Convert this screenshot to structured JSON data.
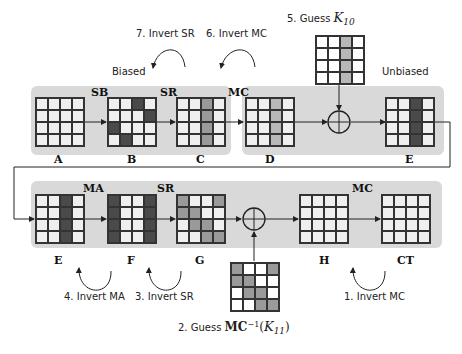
{
  "colors": {
    "panel": "#d9d9d9",
    "cell_light": "#efefef",
    "cell_white": "#ffffff",
    "cell_dark": "#4a4a4a",
    "cell_medium": "#9a9a9a",
    "cell_lightgray": "#b8b8b8",
    "line": "#222222"
  },
  "top_row": {
    "annotations": {
      "biased": "Biased",
      "unbiased": "Unbiased",
      "step7": "7. Invert SR",
      "step6": "6. Invert MC",
      "step5_prefix": "5. Guess",
      "step5_key": "K",
      "step5_sub": "10"
    },
    "ops": {
      "sb": "SB",
      "sr": "SR",
      "mc": "MC"
    },
    "states": [
      {
        "label": "A",
        "cells": [
          "g",
          "g",
          "g",
          "g",
          "g",
          "g",
          "g",
          "g",
          "g",
          "g",
          "g",
          "g",
          "g",
          "g",
          "g",
          "g"
        ]
      },
      {
        "label": "B",
        "cells": [
          "g",
          "g",
          "d",
          "g",
          "g",
          "g",
          "g",
          "d",
          "d",
          "g",
          "g",
          "g",
          "g",
          "d",
          "g",
          "g"
        ]
      },
      {
        "label": "C",
        "cells": [
          "g",
          "g",
          "m",
          "g",
          "g",
          "g",
          "m",
          "g",
          "g",
          "g",
          "m",
          "g",
          "g",
          "g",
          "m",
          "g"
        ]
      },
      {
        "label": "D",
        "cells": [
          "g",
          "g",
          "l",
          "g",
          "g",
          "g",
          "l",
          "g",
          "g",
          "g",
          "l",
          "g",
          "g",
          "g",
          "l",
          "g"
        ]
      },
      {
        "label": "E",
        "cells": [
          "g",
          "g",
          "d",
          "g",
          "g",
          "g",
          "d",
          "g",
          "g",
          "g",
          "d",
          "g",
          "g",
          "g",
          "d",
          "g"
        ]
      }
    ],
    "key_grid": {
      "cells": [
        "w",
        "w",
        "l",
        "w",
        "w",
        "w",
        "l",
        "w",
        "w",
        "w",
        "l",
        "w",
        "w",
        "w",
        "l",
        "w"
      ]
    }
  },
  "bottom_row": {
    "annotations": {
      "step4": "4. Invert MA",
      "step3": "3. Invert SR",
      "step2_prefix": "2. Guess",
      "step2_mc": "MC",
      "step2_sup": "−1",
      "step2_key": "K",
      "step2_sub": "11",
      "step1": "1. Invert MC"
    },
    "ops": {
      "ma": "MA",
      "sr": "SR",
      "mc": "MC"
    },
    "states": [
      {
        "label": "E",
        "cells": [
          "g",
          "g",
          "d",
          "g",
          "g",
          "g",
          "d",
          "g",
          "g",
          "g",
          "d",
          "g",
          "g",
          "g",
          "d",
          "g"
        ]
      },
      {
        "label": "F",
        "cells": [
          "d",
          "g",
          "g",
          "d",
          "d",
          "g",
          "g",
          "d",
          "d",
          "g",
          "g",
          "d",
          "d",
          "g",
          "g",
          "d"
        ]
      },
      {
        "label": "G",
        "cells": [
          "m",
          "g",
          "g",
          "m",
          "m",
          "m",
          "g",
          "g",
          "g",
          "m",
          "m",
          "g",
          "g",
          "g",
          "m",
          "m"
        ]
      },
      {
        "label": "H",
        "cells": [
          "g",
          "g",
          "g",
          "g",
          "g",
          "g",
          "g",
          "g",
          "g",
          "g",
          "g",
          "g",
          "g",
          "g",
          "g",
          "g"
        ]
      },
      {
        "label": "CT",
        "cells": [
          "g",
          "g",
          "g",
          "g",
          "g",
          "g",
          "g",
          "g",
          "g",
          "g",
          "g",
          "g",
          "g",
          "g",
          "g",
          "g"
        ]
      }
    ],
    "key_grid": {
      "cells": [
        "m",
        "w",
        "w",
        "m",
        "m",
        "m",
        "w",
        "w",
        "w",
        "m",
        "m",
        "w",
        "w",
        "w",
        "m",
        "m"
      ]
    }
  }
}
